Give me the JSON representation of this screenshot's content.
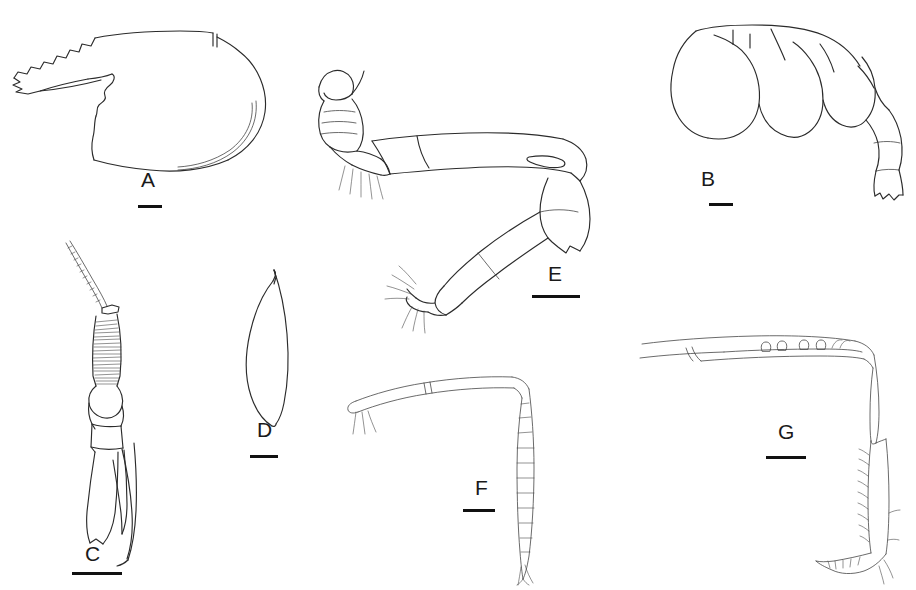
{
  "plate": {
    "title": "Crustacean morphology plate",
    "background_color": "#ffffff",
    "ink_color": "#2b2b2b",
    "width": 916,
    "height": 590,
    "panel_count": 7
  },
  "panels": [
    {
      "id": "A",
      "label": "A",
      "subject": "carapace with serrated rostrum",
      "label_x": 141,
      "label_y": 169,
      "scalebar_x": 138,
      "scalebar_y": 205,
      "scalebar_width": 24
    },
    {
      "id": "B",
      "label": "B",
      "subject": "abdomen with telson",
      "label_x": 701,
      "label_y": 168,
      "scalebar_x": 709,
      "scalebar_y": 203,
      "scalebar_width": 24
    },
    {
      "id": "C",
      "label": "C",
      "subject": "antenna with annulated flagellum and scaphocerite",
      "label_x": 85,
      "label_y": 543,
      "scalebar_x": 72,
      "scalebar_y": 572,
      "scalebar_width": 50
    },
    {
      "id": "D",
      "label": "D",
      "subject": "blade-shaped appendage",
      "label_x": 257,
      "label_y": 419,
      "scalebar_x": 250,
      "scalebar_y": 455,
      "scalebar_width": 28
    },
    {
      "id": "E",
      "label": "E",
      "subject": "pereopod with articulated segments and setae",
      "label_x": 548,
      "label_y": 263,
      "scalebar_x": 532,
      "scalebar_y": 295,
      "scalebar_width": 48
    },
    {
      "id": "F",
      "label": "F",
      "subject": "bent appendage with long segmented flagellum",
      "label_x": 475,
      "label_y": 477,
      "scalebar_x": 463,
      "scalebar_y": 509,
      "scalebar_width": 32
    },
    {
      "id": "G",
      "label": "G",
      "subject": "L-shaped pereopod with spines",
      "label_x": 778,
      "label_y": 421,
      "scalebar_x": 766,
      "scalebar_y": 456,
      "scalebar_width": 40
    }
  ]
}
